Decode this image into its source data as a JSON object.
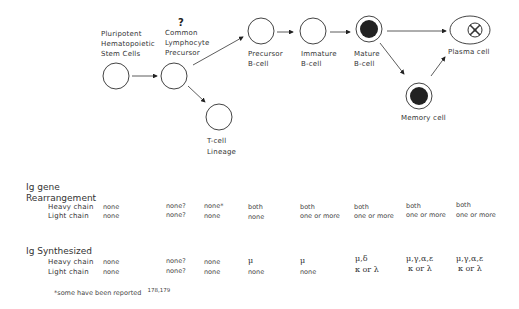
{
  "diagram": {
    "nodes": [
      {
        "id": "stem",
        "label_lines": [
          "Pluripotent",
          "Hematopoietic",
          "Stem Cells"
        ]
      },
      {
        "id": "clp",
        "question_mark": "?",
        "label_lines": [
          "Common",
          "Lymphocyte",
          "Precursor"
        ]
      },
      {
        "id": "tcell",
        "label_lines": [
          "T-cell",
          "Lineage"
        ]
      },
      {
        "id": "preb",
        "label_lines": [
          "Precursor",
          "B-cell"
        ]
      },
      {
        "id": "immb",
        "label_lines": [
          "Immature",
          "B-cell"
        ]
      },
      {
        "id": "matb",
        "label_lines": [
          "Mature",
          "B-cell"
        ]
      },
      {
        "id": "memory",
        "label_lines": [
          "Memory cell"
        ]
      },
      {
        "id": "plasma",
        "label_lines": [
          "Plasma cell"
        ]
      }
    ],
    "edges": [
      [
        "stem",
        "clp"
      ],
      [
        "clp",
        "preb"
      ],
      [
        "clp",
        "tcell"
      ],
      [
        "preb",
        "immb"
      ],
      [
        "immb",
        "matb"
      ],
      [
        "matb",
        "plasma"
      ],
      [
        "matb",
        "memory"
      ],
      [
        "memory",
        "plasma"
      ]
    ]
  },
  "table": {
    "rearrangement": {
      "title_lines": [
        "Ig gene",
        "Rearrangement"
      ],
      "rows": [
        {
          "label": "Heavy chain",
          "values": [
            "none",
            "none?",
            "none*",
            "both",
            "both",
            "both",
            "both",
            "both"
          ]
        },
        {
          "label": "Light chain",
          "values": [
            "none",
            "none?",
            "none",
            "none",
            "one or more",
            "one or more",
            "one or more",
            "one or more"
          ]
        }
      ]
    },
    "synthesized": {
      "title": "Ig Synthesized",
      "rows": [
        {
          "label": "Heavy chain",
          "values": [
            "none",
            "none?",
            "none",
            "μ",
            "μ",
            "μ,δ",
            "μ,γ,α,ε",
            "μ,γ,α,ε"
          ]
        },
        {
          "label": "Light chain",
          "values": [
            "none",
            "none?",
            "none",
            "none",
            "none",
            "κ or λ",
            "κ or λ",
            "κ or λ"
          ]
        }
      ]
    }
  },
  "footnote": {
    "text": "*some have been reported",
    "superscript": "178,179"
  }
}
